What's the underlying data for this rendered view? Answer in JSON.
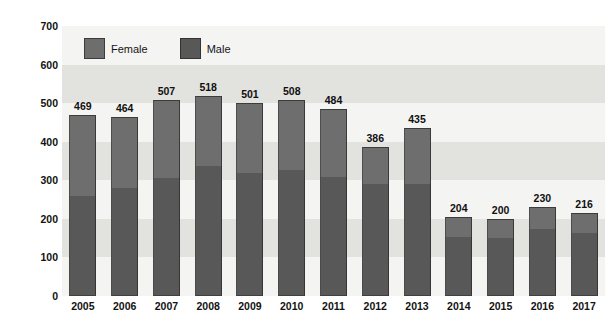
{
  "chart_data": {
    "type": "bar",
    "subtype": "stacked-bar",
    "title": "",
    "xlabel": "",
    "ylabel": "Number of Cases",
    "ylim": [
      0,
      700
    ],
    "ytick_step": 100,
    "yticks": [
      0,
      100,
      200,
      300,
      400,
      500,
      600,
      700
    ],
    "grid": false,
    "background_bands": true,
    "legend_position": "top-left inside plot",
    "categories": [
      "2005",
      "2006",
      "2007",
      "2008",
      "2009",
      "2010",
      "2011",
      "2012",
      "2013",
      "2014",
      "2015",
      "2016",
      "2017"
    ],
    "totals": [
      469,
      464,
      507,
      518,
      501,
      508,
      484,
      386,
      435,
      204,
      200,
      230,
      216
    ],
    "series": [
      {
        "name": "Female",
        "color": "#6e6e6e",
        "values": [
          210,
          185,
          200,
          180,
          182,
          181,
          176,
          96,
          144,
          52,
          50,
          57,
          52
        ]
      },
      {
        "name": "Male",
        "color": "#585858",
        "values": [
          259,
          279,
          307,
          338,
          319,
          327,
          308,
          290,
          291,
          152,
          150,
          173,
          164
        ]
      }
    ],
    "data_labels": [
      "469",
      "464",
      "507",
      "518",
      "501",
      "508",
      "484",
      "386",
      "435",
      "204",
      "200",
      "230",
      "216"
    ]
  },
  "legend": {
    "items": [
      {
        "label": "Female",
        "swatch": "legend-swatch-female"
      },
      {
        "label": "Male",
        "swatch": "legend-swatch-male"
      }
    ]
  },
  "axis": {
    "y_title": "Number of Cases",
    "y_tick_labels": [
      "700",
      "600",
      "500",
      "400",
      "300",
      "200",
      "100",
      "0"
    ],
    "x_tick_labels": [
      "2005",
      "2006",
      "2007",
      "2008",
      "2009",
      "2010",
      "2011",
      "2012",
      "2013",
      "2014",
      "2015",
      "2016",
      "2017"
    ]
  },
  "colors": {
    "female": "#6e6e6e",
    "male": "#585858",
    "plot_background": "#f2f2f0",
    "band_dark": "#e2e2df",
    "text": "#121212"
  }
}
